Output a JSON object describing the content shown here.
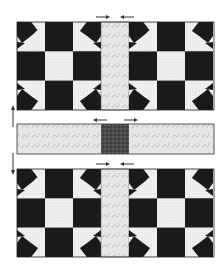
{
  "diagram": {
    "colors": {
      "dark": "#1a1a1a",
      "light_print": "#ececec",
      "sashing": "#e2e2e2",
      "cornerstone": "#555555",
      "outline": "#222222",
      "arrow": "#333333"
    },
    "rows": [
      {
        "type": "block-row",
        "label": "top block row",
        "blocks": 2,
        "pressing_arrows": "toward center sashing"
      },
      {
        "type": "sashing-row",
        "label": "sashing row with cornerstone",
        "pressing_arrows": "away from cornerstone"
      },
      {
        "type": "block-row",
        "label": "bottom block row",
        "blocks": 2,
        "pressing_arrows": "toward center sashing"
      }
    ],
    "side_arrows": [
      "up arrow between top row and sashing row",
      "down arrow between sashing row and bottom row"
    ]
  }
}
